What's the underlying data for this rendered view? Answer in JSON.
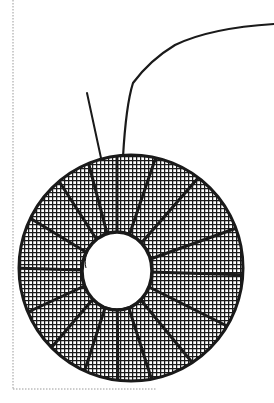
{
  "illustration": {
    "subject": "toroidal coil drawing",
    "description": "Hand-drawn toroid core wrapped with cross-hatched winding segments and two lead wires",
    "segment_count": 16,
    "colors": {
      "ink": "#1a1a1a",
      "background": "#ffffff",
      "frame": "#9a9a9a"
    }
  }
}
